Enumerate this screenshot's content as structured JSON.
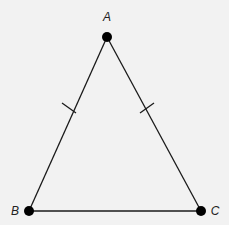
{
  "diagram": {
    "type": "isosceles-triangle",
    "colors": {
      "background": "#f2f2f2",
      "stroke": "#1a1a1a",
      "vertex": "#000000",
      "label": "#222222"
    },
    "vertices": [
      {
        "id": "A",
        "label": "A",
        "x": 107,
        "y": 37,
        "label_x": 107,
        "label_y": 21
      },
      {
        "id": "B",
        "label": "B",
        "x": 29,
        "y": 211,
        "label_x": 15,
        "label_y": 215
      },
      {
        "id": "C",
        "label": "C",
        "x": 201,
        "y": 211,
        "label_x": 215,
        "label_y": 215
      }
    ],
    "segments": [
      {
        "id": "AB",
        "from": "A",
        "to": "B",
        "congruence_ticks": 1
      },
      {
        "id": "AC",
        "from": "A",
        "to": "C",
        "congruence_ticks": 1
      },
      {
        "id": "BC",
        "from": "B",
        "to": "C",
        "congruence_ticks": 0
      }
    ],
    "congruent_sides": [
      "AB",
      "AC"
    ]
  }
}
